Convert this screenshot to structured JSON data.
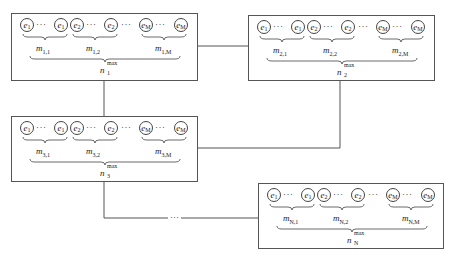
{
  "diagram": {
    "type": "network-of-nodes",
    "line_color": "#555555",
    "nodes": [
      {
        "id": "node-1",
        "index": "1",
        "elements": [
          "e1",
          "e1",
          "e2",
          "e2",
          "eM",
          "eM"
        ],
        "groups": [
          {
            "label": "m",
            "sub": "1,1"
          },
          {
            "label": "m",
            "sub": "1,2"
          },
          {
            "label": "m",
            "sub": "1,M"
          }
        ],
        "total": {
          "label": "n",
          "sup": "max",
          "sub": "1"
        }
      },
      {
        "id": "node-2",
        "index": "2",
        "elements": [
          "e1",
          "e1",
          "e2",
          "e2",
          "eM",
          "eM"
        ],
        "groups": [
          {
            "label": "m",
            "sub": "2,1"
          },
          {
            "label": "m",
            "sub": "2,2"
          },
          {
            "label": "m",
            "sub": "2,M"
          }
        ],
        "total": {
          "label": "n",
          "sup": "max",
          "sub": "2"
        }
      },
      {
        "id": "node-3",
        "index": "3",
        "elements": [
          "e1",
          "e1",
          "e2",
          "e2",
          "eM",
          "eM"
        ],
        "groups": [
          {
            "label": "m",
            "sub": "3,1"
          },
          {
            "label": "m",
            "sub": "3,2"
          },
          {
            "label": "m",
            "sub": "3,M"
          }
        ],
        "total": {
          "label": "n",
          "sup": "max",
          "sub": "3"
        }
      },
      {
        "id": "node-N",
        "index": "N",
        "elements": [
          "e1",
          "e1",
          "e2",
          "e2",
          "eM",
          "eM"
        ],
        "groups": [
          {
            "label": "m",
            "sub": "N,1"
          },
          {
            "label": "m",
            "sub": "N,2"
          },
          {
            "label": "m",
            "sub": "N,M"
          }
        ],
        "total": {
          "label": "n",
          "sup": "max",
          "sub": "N"
        }
      }
    ],
    "element_labels": {
      "e": "e",
      "sub1": "1",
      "sub2": "2",
      "subM": "M"
    },
    "inline_dots": "···",
    "connector_ellipsis": "···",
    "edges": [
      {
        "from": "node-1",
        "to": "node-2"
      },
      {
        "from": "node-1",
        "to": "node-3"
      },
      {
        "from": "node-2",
        "to": "node-3"
      },
      {
        "from": "node-3",
        "to": "node-N",
        "elided": true
      }
    ]
  }
}
